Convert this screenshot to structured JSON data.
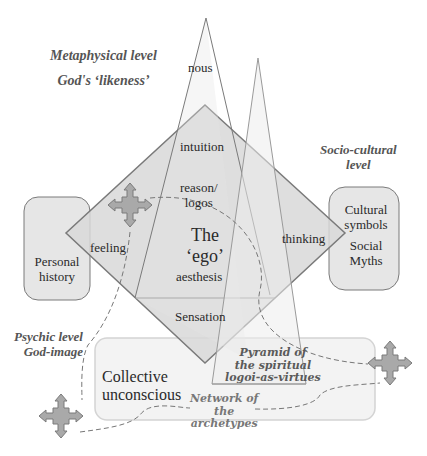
{
  "levels": {
    "metaphysical": {
      "line1": "Metaphysical level",
      "line2": "God's ‘likeness’"
    },
    "sociocultural": {
      "line1": "Socio-cultural",
      "line2": "level"
    },
    "psychic": {
      "line1": "Psychic level",
      "line2": "God-image"
    }
  },
  "boxes": {
    "personal_history": {
      "line1": "Personal",
      "line2": "history"
    },
    "cultural": {
      "line1": "Cultural",
      "line2": "symbols",
      "line3": "Social",
      "line4": "Myths"
    },
    "collective": {
      "line1": "Collective",
      "line2": "unconscious"
    }
  },
  "diamond": {
    "intuition": "intuition",
    "feeling": "feeling",
    "thinking": "thinking",
    "sensation": "Sensation",
    "ego_line1": "The",
    "ego_line2": "‘ego’",
    "reason_line1": "reason/",
    "reason_line2": "logos",
    "aesthesis": "aesthesis"
  },
  "pyramid": {
    "nous": "nous",
    "line1": "Pyramid of",
    "line2": "the spiritual",
    "line3": "logoi-as-virtues"
  },
  "network": {
    "line1": "Network of",
    "line2": "the",
    "line3": "archetypes"
  },
  "colors": {
    "fill": "#d4d4d4",
    "stroke": "#7a7a7a",
    "box_fill": "#e8e8e8",
    "arrow_fill": "#a9a9a9"
  }
}
